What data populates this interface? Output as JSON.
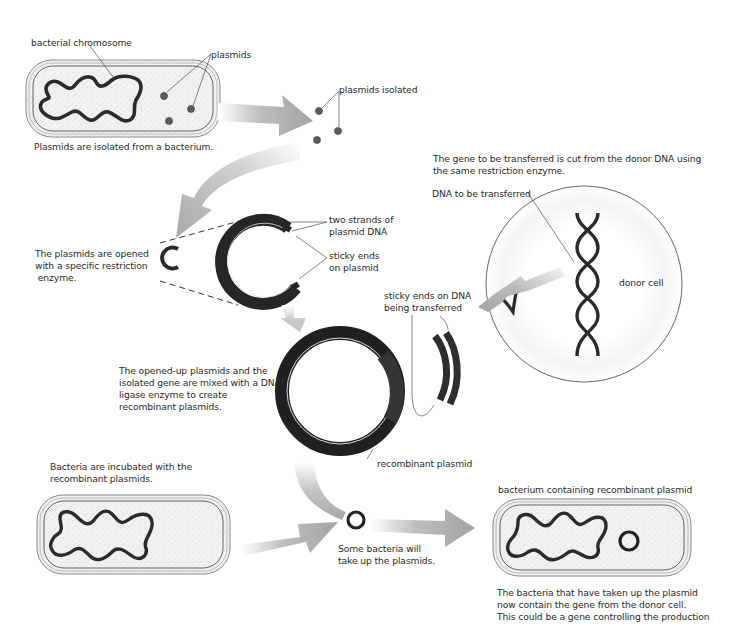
{
  "diagram": {
    "colors": {
      "dna": "#2b2b2b",
      "arrow": "#a9a9a9",
      "cell_fill": "#eeeeee",
      "cell_wall": "#777777",
      "plasmid_dot": "#5a5a5a",
      "donor_cell_outline": "#555555"
    },
    "labels": {
      "bacterial_chromosome": "bacterial chromosome",
      "plasmids": "plasmids",
      "plasmids_isolated": "plasmids isolated",
      "step1_caption": "Plasmids are isolated from a bacterium.",
      "step2_caption_line1": "The plasmids are opened",
      "step2_caption_line2": "with a specific restriction",
      "step2_caption_line3": " enzyme.",
      "two_strands_line1": "two strands of",
      "two_strands_line2": "plasmid DNA",
      "sticky_ends_plasmid_line1": "sticky ends",
      "sticky_ends_plasmid_line2": "on plasmid",
      "gene_cut_line1": "The gene to be transferred is cut from the donor DNA using",
      "gene_cut_line2": "the same restriction enzyme.",
      "dna_to_be_transferred": "DNA to be transferred",
      "donor_cell": "donor cell",
      "sticky_ends_dna_line1": "sticky ends on DNA",
      "sticky_ends_dna_line2": "being transferred",
      "ligase_line1": "The opened-up plasmids and the",
      "ligase_line2": "isolated gene are mixed with a DNA",
      "ligase_line3": "ligase enzyme to create",
      "ligase_line4": "recombinant plasmids.",
      "recombinant_plasmid": "recombinant plasmid",
      "incubate_line1": "Bacteria are incubated with the",
      "incubate_line2": "recombinant plasmids.",
      "uptake_line1": "Some bacteria will",
      "uptake_line2": "take up the plasmids.",
      "bacterium_recombinant": "bacterium containing recombinant plasmid",
      "result_line1": "The bacteria that have taken up the plasmid",
      "result_line2": "now contain the gene from the donor cell.",
      "result_line3": "This could be a gene controlling the production"
    }
  }
}
